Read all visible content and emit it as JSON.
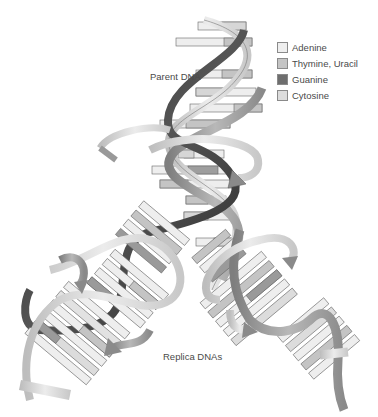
{
  "figure": {
    "labels": {
      "parent": "Parent DNA",
      "replicas": "Replica DNAs"
    },
    "legend": [
      {
        "name": "Adenine",
        "color": "#eeeeee"
      },
      {
        "name": "Thymine, Uracil",
        "color": "#c4c4c4"
      },
      {
        "name": "Guanine",
        "color": "#6e6e6e"
      },
      {
        "name": "Cytosine",
        "color": "#dcdcdc"
      }
    ],
    "colors": {
      "dark_strand": "#3a3a3a",
      "mid_strand": "#9a9a9a",
      "light_strand": "#d2d2d2",
      "outline": "#555555"
    }
  }
}
